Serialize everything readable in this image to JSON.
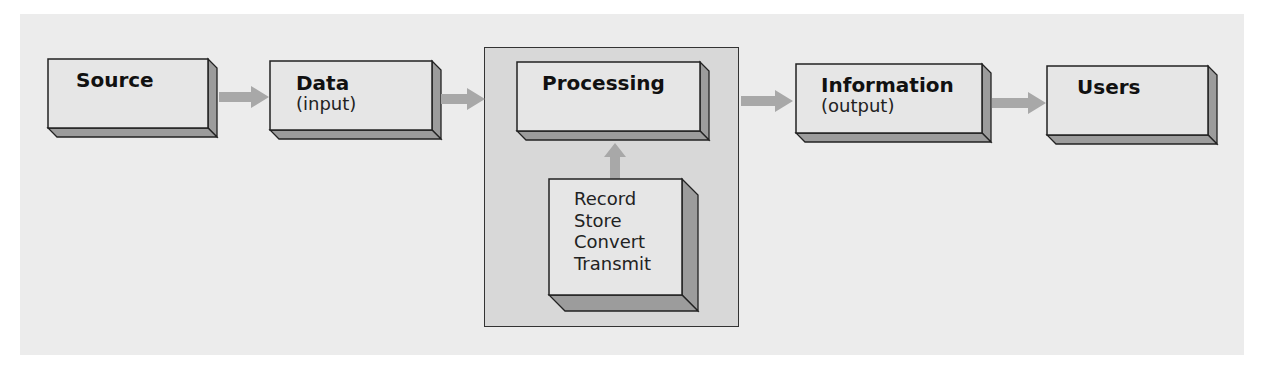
{
  "diagram": {
    "type": "flowchart",
    "colors": {
      "panel_bg": "#ececec",
      "box_face": "#e6e6e6",
      "box_depth": "#9c9c9c",
      "container_bg": "#d8d8d8",
      "arrow": "#a8a8a8",
      "border": "#222222"
    },
    "nodes": [
      {
        "id": "source",
        "title": "Source",
        "subtitle": ""
      },
      {
        "id": "data",
        "title": "Data",
        "subtitle": "(input)"
      },
      {
        "id": "processing",
        "title": "Processing",
        "subtitle": ""
      },
      {
        "id": "information",
        "title": "Information",
        "subtitle": "(output)"
      },
      {
        "id": "users",
        "title": "Users",
        "subtitle": ""
      }
    ],
    "processing_steps": {
      "lines": [
        "Record",
        "Store",
        "Convert",
        "Transmit"
      ]
    },
    "edges": [
      {
        "from": "source",
        "to": "data"
      },
      {
        "from": "data",
        "to": "processing"
      },
      {
        "from": "processing_steps",
        "to": "processing"
      },
      {
        "from": "processing",
        "to": "information"
      },
      {
        "from": "information",
        "to": "users"
      }
    ]
  }
}
